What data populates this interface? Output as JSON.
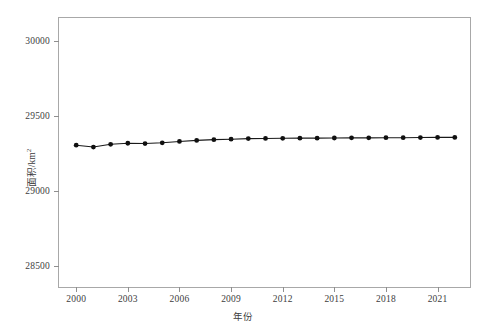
{
  "chart_data": {
    "type": "line",
    "title": "",
    "xlabel": "年份",
    "ylabel": "面积/km2",
    "ylabel_base": "面积/km",
    "ylabel_sup": "2",
    "xlim": [
      1999,
      2023
    ],
    "ylim": [
      28350,
      30150
    ],
    "xticks": [
      2000,
      2003,
      2006,
      2009,
      2012,
      2015,
      2018,
      2021
    ],
    "xtick_labels": [
      "2000",
      "2003",
      "2006",
      "2009",
      "2012",
      "2015",
      "2018",
      "2021"
    ],
    "yticks": [
      28500,
      29000,
      29500,
      30000
    ],
    "ytick_labels": [
      "28500",
      "29000",
      "29500",
      "30000"
    ],
    "grid": false,
    "legend": null,
    "marker": "circle",
    "line_color": "#1a1a1a",
    "marker_color": "#101010",
    "series": [
      {
        "name": "面积",
        "x": [
          2000,
          2001,
          2002,
          2003,
          2004,
          2005,
          2006,
          2007,
          2008,
          2009,
          2010,
          2011,
          2012,
          2013,
          2014,
          2015,
          2016,
          2017,
          2018,
          2019,
          2020,
          2021,
          2022
        ],
        "values": [
          29305,
          29293,
          29311,
          29318,
          29316,
          29321,
          29330,
          29337,
          29342,
          29345,
          29349,
          29350,
          29351,
          29352,
          29352,
          29353,
          29354,
          29354,
          29355,
          29355,
          29356,
          29357,
          29357
        ]
      }
    ]
  }
}
